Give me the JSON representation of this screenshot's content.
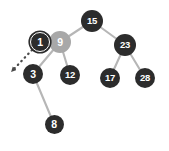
{
  "figure": {
    "background_color": "#ffffff",
    "edge_color": "#b6b6b6",
    "node_dark_color": "#2c2c2c",
    "node_muted_color": "#a8a8a8",
    "node_text_color": "#ffffff",
    "arrow_color": "#4a4a4a"
  },
  "chart_data": {
    "type": "diagram",
    "nodes": [
      {
        "id": "n15",
        "label": "15",
        "x": 92,
        "y": 21,
        "r": 11.0,
        "style": "dark",
        "role": "root"
      },
      {
        "id": "n9",
        "label": "9",
        "x": 60,
        "y": 42,
        "r": 11.0,
        "style": "muted",
        "role": "removed-node"
      },
      {
        "id": "n1",
        "label": "1",
        "x": 40,
        "y": 42,
        "r": 10.0,
        "style": "highlight",
        "role": "replacement-node"
      },
      {
        "id": "n23",
        "label": "23",
        "x": 125,
        "y": 45,
        "r": 11.0,
        "style": "dark",
        "role": "internal"
      },
      {
        "id": "n3",
        "label": "3",
        "x": 33,
        "y": 74,
        "r": 10.0,
        "style": "dark",
        "role": "internal"
      },
      {
        "id": "n12",
        "label": "12",
        "x": 70,
        "y": 75,
        "r": 10.0,
        "style": "dark",
        "role": "leaf"
      },
      {
        "id": "n17",
        "label": "17",
        "x": 110,
        "y": 78,
        "r": 10.0,
        "style": "dark",
        "role": "leaf"
      },
      {
        "id": "n28",
        "label": "28",
        "x": 145,
        "y": 78,
        "r": 10.0,
        "style": "dark",
        "role": "leaf"
      },
      {
        "id": "n8",
        "label": "8",
        "x": 54,
        "y": 124,
        "r": 9.5,
        "style": "dark",
        "role": "leaf"
      }
    ],
    "edges": [
      {
        "from": "n15",
        "to": "n9"
      },
      {
        "from": "n15",
        "to": "n23"
      },
      {
        "from": "n9",
        "to": "n3"
      },
      {
        "from": "n9",
        "to": "n12"
      },
      {
        "from": "n23",
        "to": "n17"
      },
      {
        "from": "n23",
        "to": "n28"
      },
      {
        "from": "n3",
        "to": "n8"
      }
    ],
    "annotations": [
      {
        "id": "move-arrow",
        "type": "dotted-arrow",
        "from_x": 32,
        "from_y": 50,
        "to_x": 13,
        "to_y": 70,
        "note": "dotted arrow pointing down-left away from node 1"
      }
    ],
    "legend": [],
    "xlabel": "",
    "ylabel": ""
  }
}
